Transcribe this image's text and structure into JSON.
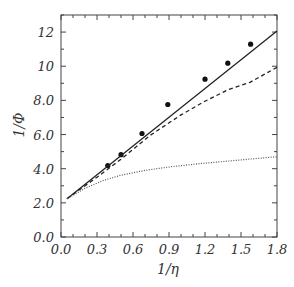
{
  "chart_data": {
    "type": "line",
    "title": "",
    "xlabel": "1/η",
    "ylabel": "1/Φ",
    "xlim": [
      0.0,
      1.8
    ],
    "ylim": [
      0.0,
      13.0
    ],
    "grid": false,
    "legend": null,
    "x_ticks": [
      0.0,
      0.3,
      0.6,
      0.9,
      1.2,
      1.5,
      1.8
    ],
    "x_tick_labels": [
      "0.0",
      "0.3",
      "0.6",
      "0.9",
      "1.2",
      "1.5",
      "1.8"
    ],
    "y_ticks": [
      0,
      2,
      4,
      6,
      8,
      10,
      12
    ],
    "y_tick_labels": [
      "0.0",
      "2.0",
      "4.0",
      "6.0",
      "8.0",
      "10",
      "12"
    ],
    "series": [
      {
        "name": "measured",
        "style": "markers",
        "x": [
          0.39,
          0.5,
          0.675,
          0.89,
          1.2,
          1.39,
          1.58
        ],
        "y": [
          4.18,
          4.82,
          6.06,
          7.76,
          9.24,
          10.18,
          11.29
        ]
      },
      {
        "name": "solid",
        "style": "solid",
        "x": [
          0.05,
          1.8
        ],
        "y": [
          2.24,
          12.06
        ]
      },
      {
        "name": "dashed",
        "style": "dashed",
        "x": [
          0.05,
          0.3,
          0.5,
          0.74,
          1.0,
          1.2,
          1.4,
          1.575,
          1.8
        ],
        "y": [
          2.24,
          3.5,
          4.55,
          5.94,
          7.15,
          7.95,
          8.65,
          9.06,
          9.94
        ]
      },
      {
        "name": "dotted",
        "style": "dotted",
        "x": [
          0.05,
          0.2,
          0.35,
          0.49,
          0.7,
          0.9,
          1.16,
          1.4,
          1.6,
          1.8
        ],
        "y": [
          2.24,
          2.85,
          3.3,
          3.6,
          3.9,
          4.1,
          4.3,
          4.45,
          4.58,
          4.7
        ]
      }
    ]
  }
}
